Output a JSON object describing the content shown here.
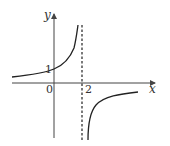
{
  "diagram": {
    "type": "function-graph",
    "axes": {
      "x_label": "x",
      "y_label": "y",
      "origin_label": "0"
    },
    "ticks": {
      "y_intercept_label": "1",
      "asymptote_label": "2"
    },
    "asymptote": {
      "x": 2,
      "style": "dashed",
      "color": "#222222"
    },
    "curve_color": "#222222",
    "axis_color": "#444444"
  }
}
